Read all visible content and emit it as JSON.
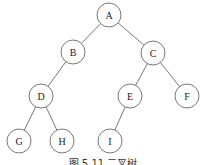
{
  "diagram": {
    "type": "binary-tree",
    "caption": "图 5.11  二叉树",
    "nodes": [
      {
        "id": "A",
        "label": "A",
        "x": 109,
        "y": 15
      },
      {
        "id": "B",
        "label": "B",
        "x": 73,
        "y": 52
      },
      {
        "id": "C",
        "label": "C",
        "x": 153,
        "y": 53
      },
      {
        "id": "D",
        "label": "D",
        "x": 41,
        "y": 96
      },
      {
        "id": "E",
        "label": "E",
        "x": 130,
        "y": 96
      },
      {
        "id": "F",
        "label": "F",
        "x": 187,
        "y": 96
      },
      {
        "id": "G",
        "label": "G",
        "x": 19,
        "y": 141
      },
      {
        "id": "H",
        "label": "H",
        "x": 62,
        "y": 141
      },
      {
        "id": "I",
        "label": "I",
        "x": 110,
        "y": 141
      }
    ],
    "edges": [
      {
        "from": "A",
        "to": "B"
      },
      {
        "from": "A",
        "to": "C"
      },
      {
        "from": "B",
        "to": "D"
      },
      {
        "from": "C",
        "to": "E"
      },
      {
        "from": "C",
        "to": "F"
      },
      {
        "from": "D",
        "to": "G"
      },
      {
        "from": "D",
        "to": "H"
      },
      {
        "from": "E",
        "to": "I"
      }
    ],
    "node_radius": 12,
    "colors": {
      "stroke": "#555555",
      "fill": "#ffffff",
      "text": "#222222"
    }
  }
}
